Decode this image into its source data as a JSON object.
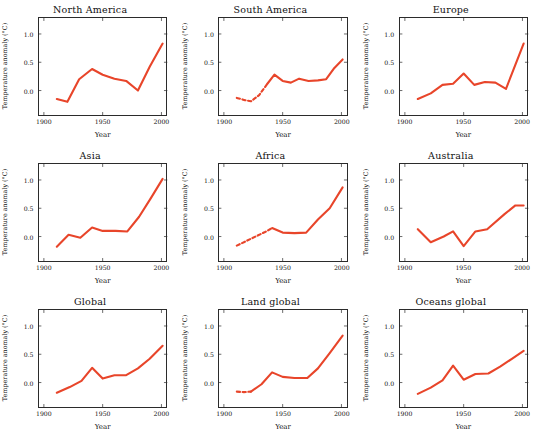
{
  "figure": {
    "layout": "3x3 grid of line charts",
    "rows": 3,
    "cols": 3,
    "line_color": "#E8452A",
    "axis_color": "#2b2b2b"
  },
  "chart_data": [
    {
      "type": "line",
      "title": "North America",
      "xlabel": "Year",
      "ylabel": "Temperature anomaly (°C)",
      "xlim": [
        1895,
        2005
      ],
      "ylim": [
        -0.45,
        1.3
      ],
      "xticks": [
        1900,
        1950,
        2000
      ],
      "xticklabels": [
        "1900",
        "1950",
        "2000"
      ],
      "yticks": [
        0.0,
        0.5,
        1.0
      ],
      "yticklabels": [
        "0.0",
        "0.5",
        "1.0"
      ],
      "grid": false,
      "legend": "none",
      "series": [
        {
          "name": "Solid segment",
          "style": "solid",
          "x": [
            1911,
            1920,
            1930,
            1941,
            1950,
            1960,
            1970,
            1980,
            1990,
            2001
          ],
          "values": [
            -0.15,
            -0.2,
            0.2,
            0.38,
            0.28,
            0.21,
            0.17,
            0.0,
            0.42,
            0.83
          ]
        }
      ]
    },
    {
      "type": "line",
      "title": "South America",
      "xlabel": "Year",
      "ylabel": "Temperature anomaly (°C)",
      "xlim": [
        1895,
        2005
      ],
      "ylim": [
        -0.45,
        1.3
      ],
      "xticks": [
        1900,
        1950,
        2000
      ],
      "xticklabels": [
        "1900",
        "1950",
        "2000"
      ],
      "yticks": [
        0.0,
        0.5,
        1.0
      ],
      "yticklabels": [
        "0.0",
        "0.5",
        "1.0"
      ],
      "grid": false,
      "legend": "none",
      "series": [
        {
          "name": "Dashed early segment",
          "style": "dashed",
          "x": [
            1911,
            1918,
            1923,
            1930,
            1937
          ],
          "values": [
            -0.13,
            -0.17,
            -0.19,
            -0.08,
            0.12
          ]
        },
        {
          "name": "Solid segment",
          "style": "solid",
          "x": [
            1937,
            1943,
            1950,
            1957,
            1964,
            1972,
            1980,
            1987,
            1994,
            2001
          ],
          "values": [
            0.12,
            0.28,
            0.17,
            0.14,
            0.21,
            0.17,
            0.18,
            0.2,
            0.4,
            0.55
          ]
        }
      ]
    },
    {
      "type": "line",
      "title": "Europe",
      "xlabel": "Year",
      "ylabel": "Temperature anomaly (°C)",
      "xlim": [
        1895,
        2005
      ],
      "ylim": [
        -0.45,
        1.3
      ],
      "xticks": [
        1900,
        1950,
        2000
      ],
      "xticklabels": [
        "1900",
        "1950",
        "2000"
      ],
      "yticks": [
        0.0,
        0.5,
        1.0
      ],
      "yticklabels": [
        "0.0",
        "0.5",
        "1.0"
      ],
      "grid": false,
      "legend": "none",
      "series": [
        {
          "name": "Solid segment",
          "style": "solid",
          "x": [
            1911,
            1922,
            1932,
            1941,
            1950,
            1959,
            1968,
            1977,
            1986,
            2001
          ],
          "values": [
            -0.15,
            -0.05,
            0.1,
            0.12,
            0.3,
            0.1,
            0.15,
            0.14,
            0.03,
            0.83
          ]
        }
      ]
    },
    {
      "type": "line",
      "title": "Asia",
      "xlabel": "Year",
      "ylabel": "Temperature anomaly (°C)",
      "xlim": [
        1895,
        2005
      ],
      "ylim": [
        -0.45,
        1.3
      ],
      "xticks": [
        1900,
        1950,
        2000
      ],
      "xticklabels": [
        "1900",
        "1950",
        "2000"
      ],
      "yticks": [
        0.0,
        0.5,
        1.0
      ],
      "yticklabels": [
        "0.0",
        "0.5",
        "1.0"
      ],
      "grid": false,
      "legend": "none",
      "series": [
        {
          "name": "Solid segment",
          "style": "solid",
          "x": [
            1911,
            1921,
            1931,
            1941,
            1950,
            1961,
            1971,
            1981,
            1991,
            2001
          ],
          "values": [
            -0.18,
            0.03,
            -0.02,
            0.16,
            0.1,
            0.1,
            0.09,
            0.35,
            0.68,
            1.02
          ]
        }
      ]
    },
    {
      "type": "line",
      "title": "Africa",
      "xlabel": "Year",
      "ylabel": "Temperature anomaly (°C)",
      "xlim": [
        1895,
        2005
      ],
      "ylim": [
        -0.45,
        1.3
      ],
      "xticks": [
        1900,
        1950,
        2000
      ],
      "xticklabels": [
        "1900",
        "1950",
        "2000"
      ],
      "yticks": [
        0.0,
        0.5,
        1.0
      ],
      "yticklabels": [
        "0.0",
        "0.5",
        "1.0"
      ],
      "grid": false,
      "legend": "none",
      "series": [
        {
          "name": "Dashed early segment",
          "style": "dashed",
          "x": [
            1911,
            1919,
            1927,
            1935,
            1941
          ],
          "values": [
            -0.16,
            -0.08,
            0.0,
            0.08,
            0.15
          ]
        },
        {
          "name": "Solid segment",
          "style": "solid",
          "x": [
            1941,
            1950,
            1960,
            1970,
            1980,
            1990,
            2001
          ],
          "values": [
            0.15,
            0.07,
            0.06,
            0.07,
            0.3,
            0.5,
            0.87
          ]
        }
      ]
    },
    {
      "type": "line",
      "title": "Australia",
      "xlabel": "Year",
      "ylabel": "Temperature anomaly (°C)",
      "xlim": [
        1895,
        2005
      ],
      "ylim": [
        -0.45,
        1.3
      ],
      "xticks": [
        1900,
        1950,
        2000
      ],
      "xticklabels": [
        "1900",
        "1950",
        "2000"
      ],
      "yticks": [
        0.0,
        0.5,
        1.0
      ],
      "yticklabels": [
        "0.0",
        "0.5",
        "1.0"
      ],
      "grid": false,
      "legend": "none",
      "series": [
        {
          "name": "Solid segment",
          "style": "solid",
          "x": [
            1911,
            1922,
            1933,
            1941,
            1950,
            1960,
            1970,
            1985,
            1994,
            2001
          ],
          "values": [
            0.13,
            -0.1,
            0.0,
            0.09,
            -0.17,
            0.09,
            0.13,
            0.4,
            0.55,
            0.55
          ]
        }
      ]
    },
    {
      "type": "line",
      "title": "Global",
      "xlabel": "Year",
      "ylabel": "Temperature anomaly (°C)",
      "xlim": [
        1895,
        2005
      ],
      "ylim": [
        -0.45,
        1.3
      ],
      "xticks": [
        1900,
        1950,
        2000
      ],
      "xticklabels": [
        "1900",
        "1950",
        "2000"
      ],
      "yticks": [
        0.0,
        0.5,
        1.0
      ],
      "yticklabels": [
        "0.0",
        "0.5",
        "1.0"
      ],
      "grid": false,
      "legend": "none",
      "series": [
        {
          "name": "Solid segment",
          "style": "solid",
          "x": [
            1911,
            1922,
            1932,
            1941,
            1950,
            1960,
            1970,
            1980,
            1990,
            2001
          ],
          "values": [
            -0.18,
            -0.08,
            0.03,
            0.26,
            0.07,
            0.13,
            0.13,
            0.25,
            0.42,
            0.65
          ]
        }
      ]
    },
    {
      "type": "line",
      "title": "Land global",
      "xlabel": "Year",
      "ylabel": "Temperature anomaly (°C)",
      "xlim": [
        1895,
        2005
      ],
      "ylim": [
        -0.45,
        1.3
      ],
      "xticks": [
        1900,
        1950,
        2000
      ],
      "xticklabels": [
        "1900",
        "1950",
        "2000"
      ],
      "yticks": [
        0.0,
        0.5,
        1.0
      ],
      "yticklabels": [
        "0.0",
        "0.5",
        "1.0"
      ],
      "grid": false,
      "legend": "none",
      "series": [
        {
          "name": "Dashed early segment",
          "style": "dashed",
          "x": [
            1911,
            1917,
            1923
          ],
          "values": [
            -0.16,
            -0.17,
            -0.16
          ]
        },
        {
          "name": "Solid segment",
          "style": "solid",
          "x": [
            1923,
            1932,
            1941,
            1950,
            1960,
            1971,
            1980,
            1990,
            2001
          ],
          "values": [
            -0.16,
            -0.03,
            0.18,
            0.1,
            0.08,
            0.08,
            0.25,
            0.52,
            0.83
          ]
        }
      ]
    },
    {
      "type": "line",
      "title": "Oceans global",
      "xlabel": "Year",
      "ylabel": "Temperature anomaly (°C)",
      "xlim": [
        1895,
        2005
      ],
      "ylim": [
        -0.45,
        1.3
      ],
      "xticks": [
        1900,
        1950,
        2000
      ],
      "xticklabels": [
        "1900",
        "1950",
        "2000"
      ],
      "yticks": [
        0.0,
        0.5,
        1.0
      ],
      "yticklabels": [
        "0.0",
        "0.5",
        "1.0"
      ],
      "grid": false,
      "legend": "none",
      "series": [
        {
          "name": "Solid segment",
          "style": "solid",
          "x": [
            1911,
            1922,
            1932,
            1941,
            1950,
            1960,
            1971,
            1981,
            1991,
            2001
          ],
          "values": [
            -0.2,
            -0.09,
            0.04,
            0.3,
            0.05,
            0.15,
            0.16,
            0.28,
            0.42,
            0.56
          ]
        }
      ]
    }
  ]
}
